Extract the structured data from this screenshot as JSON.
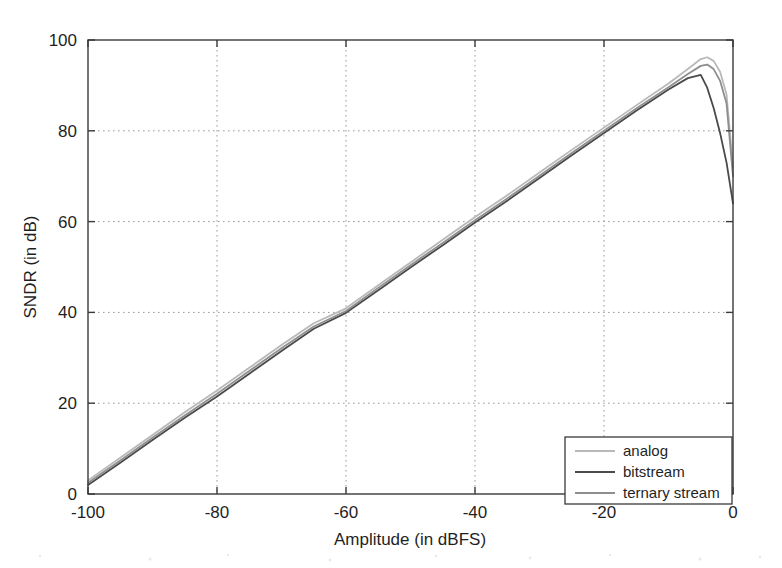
{
  "chart_data": {
    "type": "line",
    "title": "",
    "xlabel": "Amplitude (in dBFS)",
    "ylabel": "SNDR (in dB)",
    "xlim": [
      -100,
      0
    ],
    "ylim": [
      0,
      100
    ],
    "xticks": [
      -100,
      -80,
      -60,
      -40,
      -20,
      0
    ],
    "xticklabels": [
      "-100",
      "-80",
      "-60",
      "-40",
      "-20",
      "0"
    ],
    "yticks": [
      0,
      20,
      40,
      60,
      80,
      100
    ],
    "yticklabels": [
      "0",
      "20",
      "40",
      "60",
      "80",
      "100"
    ],
    "grid": true,
    "grid_style": "dotted",
    "legend_position": "lower right",
    "series": [
      {
        "name": "analog",
        "color": "#b9b9b9",
        "x": [
          -100,
          -95,
          -90,
          -85,
          -80,
          -75,
          -70,
          -65,
          -60,
          -55,
          -50,
          -45,
          -40,
          -35,
          -30,
          -25,
          -20,
          -15,
          -10,
          -7,
          -5,
          -4,
          -3,
          -2,
          -1,
          0
        ],
        "y": [
          3.0,
          8.0,
          13.0,
          18.0,
          22.8,
          27.8,
          32.8,
          37.6,
          40.9,
          46.0,
          51.0,
          56.0,
          61.0,
          65.8,
          70.8,
          75.8,
          80.7,
          85.6,
          90.4,
          93.6,
          95.8,
          96.2,
          95.4,
          93.0,
          88.0,
          72.0
        ]
      },
      {
        "name": "bitstream",
        "color": "#4a4a4a",
        "x": [
          -100,
          -95,
          -90,
          -85,
          -80,
          -75,
          -70,
          -65,
          -60,
          -55,
          -50,
          -45,
          -40,
          -35,
          -30,
          -25,
          -20,
          -15,
          -10,
          -7,
          -5,
          -4,
          -3,
          -2,
          -1,
          0
        ],
        "y": [
          2.0,
          6.9,
          11.9,
          16.8,
          21.5,
          26.5,
          31.5,
          36.4,
          39.9,
          44.9,
          49.9,
          54.8,
          59.8,
          64.6,
          69.6,
          74.6,
          79.5,
          84.4,
          89.1,
          91.6,
          92.3,
          89.5,
          85.0,
          79.5,
          73.0,
          64.0
        ]
      },
      {
        "name": "ternary stream",
        "color": "#8e8e8e",
        "x": [
          -100,
          -95,
          -90,
          -85,
          -80,
          -75,
          -70,
          -65,
          -60,
          -55,
          -50,
          -45,
          -40,
          -35,
          -30,
          -25,
          -20,
          -15,
          -10,
          -7,
          -5,
          -4,
          -3,
          -2,
          -1,
          0
        ],
        "y": [
          2.5,
          7.4,
          12.4,
          17.3,
          22.1,
          27.1,
          32.1,
          36.9,
          40.3,
          45.4,
          50.4,
          55.3,
          60.3,
          65.1,
          70.1,
          75.1,
          80.0,
          84.9,
          89.6,
          92.5,
          94.3,
          94.6,
          93.6,
          91.0,
          86.0,
          70.0
        ]
      }
    ]
  },
  "axes": {
    "ylabel": "SNDR (in dB)",
    "xlabel": "Amplitude (in dBFS)"
  },
  "legend": {
    "entries": [
      {
        "label": "analog"
      },
      {
        "label": "bitstream"
      },
      {
        "label": "ternary stream"
      }
    ]
  }
}
